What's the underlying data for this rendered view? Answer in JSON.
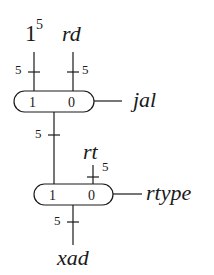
{
  "diagram": {
    "type": "multiplexer-chain",
    "inputs": {
      "const_ones": {
        "base": "1",
        "exponent": "5",
        "width": "5"
      },
      "rd": {
        "label": "rd",
        "width": "5"
      },
      "rt": {
        "label": "rt",
        "width": "5"
      }
    },
    "mux1": {
      "input1": "1",
      "input0": "0",
      "select": "jal",
      "output_width": "5"
    },
    "mux2": {
      "input1": "1",
      "input0": "0",
      "select": "rtype",
      "output_width": "5"
    },
    "output": {
      "label": "xad"
    }
  }
}
